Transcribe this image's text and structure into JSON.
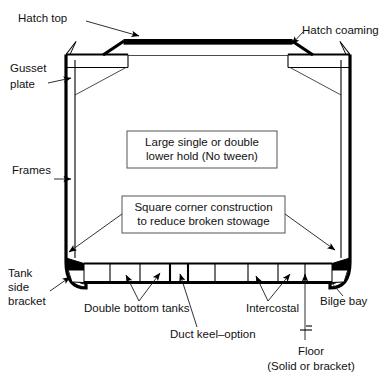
{
  "diagram": {
    "labels": {
      "hatch_top": "Hatch top",
      "hatch_coaming": "Hatch coaming",
      "gusset_plate_line1": "Gusset",
      "gusset_plate_line2": "plate",
      "frames": "Frames",
      "tank_side_bracket_line1": "Tank",
      "tank_side_bracket_line2": "side",
      "tank_side_bracket_line3": "bracket",
      "double_bottom_tanks": "Double bottom tanks",
      "duct_keel_option": "Duct keel–option",
      "intercostal": "Intercostal",
      "bilge_bay": "Bilge bay",
      "floor_line1": "Floor",
      "floor_line2": "(Solid or bracket)"
    },
    "callouts": [
      {
        "id": "lower-hold",
        "line1": "Large single or double",
        "line2": "lower hold (No tween)"
      },
      {
        "id": "square-corner",
        "line1": "Square corner construction",
        "line2": "to reduce broken stowage"
      }
    ],
    "colors": {
      "ink": "#000000",
      "background": "#ffffff",
      "box_stroke": "#555555",
      "leader": "#1a1a1a"
    }
  }
}
